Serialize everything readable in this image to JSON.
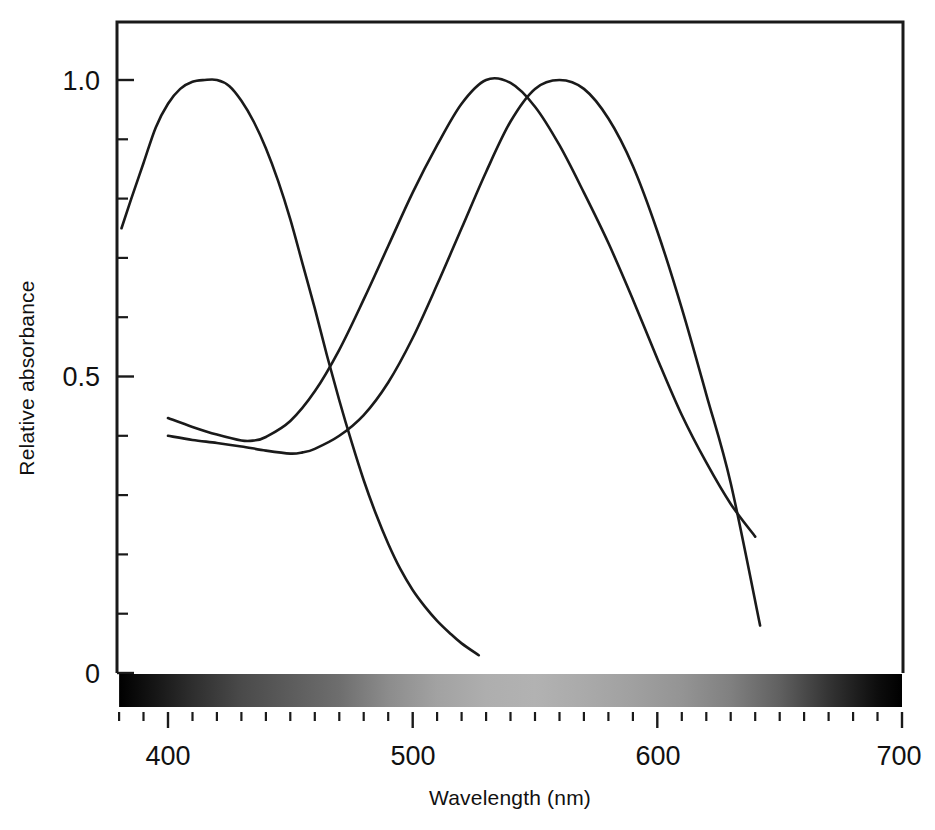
{
  "figure": {
    "title": "",
    "background_color": "#ffffff",
    "line_color": "#1a1a1a"
  },
  "axis_titles": {
    "x": "Wavelength (nm)",
    "y": "Relative absorbance"
  },
  "x_tick_labels": [
    "400",
    "500",
    "600",
    "700"
  ],
  "y_tick_labels": [
    "1.0",
    "0.5",
    "0"
  ],
  "spectrum_bar": {
    "name": "visible-spectrum-strip",
    "start_nm": 380,
    "end_nm": 700,
    "stops": [
      {
        "nm": 380,
        "color": "#000000"
      },
      {
        "nm": 395,
        "color": "#161616"
      },
      {
        "nm": 410,
        "color": "#2e2e2e"
      },
      {
        "nm": 430,
        "color": "#4a4a4a"
      },
      {
        "nm": 450,
        "color": "#5c5c5c"
      },
      {
        "nm": 470,
        "color": "#6e6e6e"
      },
      {
        "nm": 490,
        "color": "#8c8c8c"
      },
      {
        "nm": 510,
        "color": "#a2a2a2"
      },
      {
        "nm": 530,
        "color": "#aeaeae"
      },
      {
        "nm": 550,
        "color": "#b2b2b2"
      },
      {
        "nm": 570,
        "color": "#aaaaaa"
      },
      {
        "nm": 590,
        "color": "#a0a0a0"
      },
      {
        "nm": 610,
        "color": "#949494"
      },
      {
        "nm": 630,
        "color": "#808080"
      },
      {
        "nm": 650,
        "color": "#606060"
      },
      {
        "nm": 670,
        "color": "#343434"
      },
      {
        "nm": 690,
        "color": "#0d0d0d"
      },
      {
        "nm": 700,
        "color": "#000000"
      }
    ]
  },
  "chart_data": {
    "type": "line",
    "title": "",
    "xlabel": "Wavelength (nm)",
    "ylabel": "Relative absorbance",
    "xlim": [
      379,
      700
    ],
    "ylim": [
      0,
      1.08
    ],
    "xticks": [
      400,
      500,
      600,
      700
    ],
    "xticks_minor_step": 10,
    "yticks": [
      0,
      0.5,
      1.0
    ],
    "yticks_minor_step": 0.1,
    "grid": false,
    "legend": "none",
    "series": [
      {
        "name": "short-wavelength cone",
        "peak_nm": 420,
        "color": "#1a1a1a",
        "x": [
          381,
          385,
          390,
          395,
          400,
          405,
          410,
          415,
          420,
          425,
          430,
          435,
          440,
          445,
          450,
          455,
          460,
          465,
          470,
          475,
          480,
          485,
          490,
          495,
          500,
          505,
          510,
          515,
          520,
          527
        ],
        "y": [
          0.75,
          0.8,
          0.86,
          0.92,
          0.96,
          0.985,
          0.997,
          1.0,
          1.0,
          0.99,
          0.965,
          0.93,
          0.885,
          0.83,
          0.765,
          0.69,
          0.615,
          0.535,
          0.46,
          0.39,
          0.325,
          0.268,
          0.218,
          0.175,
          0.14,
          0.112,
          0.088,
          0.068,
          0.05,
          0.03
        ]
      },
      {
        "name": "middle-wavelength cone",
        "peak_nm": 530,
        "color": "#1a1a1a",
        "x": [
          400,
          410,
          420,
          430,
          435,
          440,
          450,
          460,
          470,
          480,
          490,
          500,
          510,
          520,
          530,
          540,
          550,
          560,
          570,
          580,
          590,
          600,
          610,
          620,
          630,
          640
        ],
        "y": [
          0.43,
          0.415,
          0.402,
          0.392,
          0.392,
          0.398,
          0.425,
          0.475,
          0.545,
          0.63,
          0.72,
          0.81,
          0.89,
          0.96,
          1.0,
          0.995,
          0.955,
          0.89,
          0.81,
          0.725,
          0.63,
          0.53,
          0.435,
          0.355,
          0.285,
          0.23
        ]
      },
      {
        "name": "long-wavelength cone",
        "peak_nm": 560,
        "color": "#1a1a1a",
        "x": [
          400,
          410,
          420,
          430,
          440,
          450,
          455,
          460,
          470,
          480,
          490,
          500,
          510,
          520,
          530,
          540,
          550,
          560,
          570,
          580,
          590,
          600,
          610,
          620,
          630,
          642
        ],
        "y": [
          0.4,
          0.393,
          0.388,
          0.382,
          0.375,
          0.37,
          0.372,
          0.378,
          0.4,
          0.435,
          0.49,
          0.565,
          0.655,
          0.75,
          0.845,
          0.93,
          0.985,
          1.0,
          0.985,
          0.935,
          0.855,
          0.745,
          0.615,
          0.47,
          0.32,
          0.08
        ]
      }
    ]
  }
}
